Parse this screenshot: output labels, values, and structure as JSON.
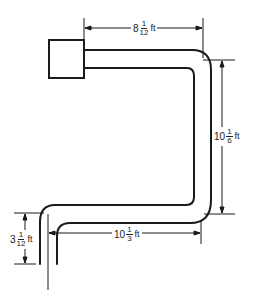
{
  "diagram": {
    "type": "pipe-layout",
    "stroke_color": "#1a1a1a",
    "dimensions": {
      "top": {
        "whole": "8",
        "num": "1",
        "den": "12",
        "unit": "ft"
      },
      "right": {
        "whole": "10",
        "num": "1",
        "den": "6",
        "unit": "ft"
      },
      "bottom": {
        "whole": "10",
        "num": "1",
        "den": "3",
        "unit": "ft"
      },
      "left": {
        "whole": "3",
        "num": "1",
        "den": "12",
        "unit": "ft"
      }
    }
  }
}
